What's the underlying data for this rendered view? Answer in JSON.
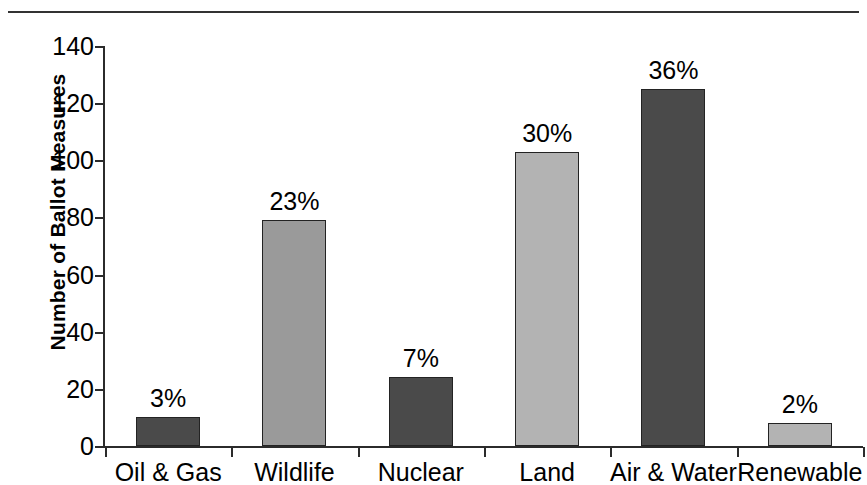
{
  "figure": {
    "top_rule_fragment": ""
  },
  "chart_data": {
    "type": "bar",
    "title": "",
    "xlabel": "",
    "ylabel": "Number of Ballot Measures",
    "categories": [
      "Oil & Gas",
      "Wildlife",
      "Nuclear",
      "Land",
      "Air & Water",
      "Renewable"
    ],
    "values": [
      10,
      79,
      24,
      103,
      125,
      8
    ],
    "data_labels": [
      "3%",
      "23%",
      "7%",
      "30%",
      "36%",
      "2%"
    ],
    "bar_colors": [
      "#4a4a4a",
      "#9a9a9a",
      "#4a4a4a",
      "#b3b3b3",
      "#4a4a4a",
      "#b3b3b3"
    ],
    "bar_shades": [
      "dark",
      "mid",
      "dark",
      "light",
      "dark",
      "light"
    ],
    "ylim": [
      0,
      140
    ],
    "yticks": [
      0,
      20,
      40,
      60,
      80,
      100,
      120,
      140
    ],
    "ytick_labels": [
      "0",
      "20",
      "40",
      "60",
      "80",
      "100",
      "120",
      "140"
    ],
    "grid": false,
    "legend": null,
    "axis_color": "#2b2b2b",
    "bar_edge_color": "#232323"
  }
}
